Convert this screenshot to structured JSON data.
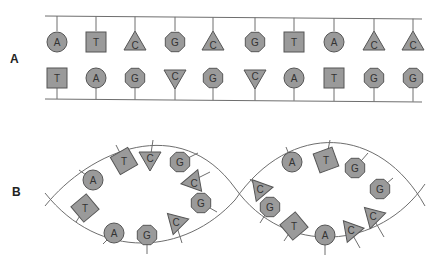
{
  "labels": {
    "panel_a": "A",
    "panel_b": "B"
  },
  "colors": {
    "base_fill": "#9a9a9a",
    "base_stroke": "#555555",
    "strand": "#6e6e6e",
    "text": "#333333"
  },
  "shape_map": {
    "A": "circle",
    "T": "square",
    "G": "octagon",
    "C": "triangle"
  },
  "panel_a": {
    "top_strand": [
      "A",
      "T",
      "C",
      "G",
      "C",
      "G",
      "T",
      "A",
      "C",
      "C"
    ],
    "bottom_strand": [
      "T",
      "A",
      "G",
      "C",
      "G",
      "C",
      "A",
      "T",
      "G",
      "G"
    ]
  },
  "panel_b": {
    "loop1_bases": [
      "A",
      "T",
      "T",
      "C",
      "G",
      "C",
      "G",
      "A",
      "G",
      "C"
    ],
    "loop2_bases": [
      "A",
      "T",
      "G",
      "G",
      "C",
      "G",
      "T",
      "A",
      "C",
      "C"
    ]
  }
}
